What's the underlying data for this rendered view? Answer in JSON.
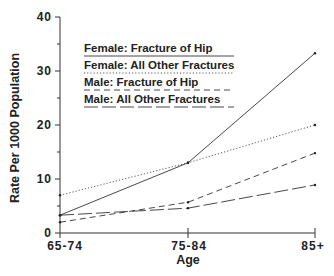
{
  "chart_data": {
    "type": "line",
    "title": "",
    "xlabel": "Age",
    "ylabel": "Rate Per 1000 Population",
    "categories": [
      "65-74",
      "75-84",
      "85+"
    ],
    "ylim": [
      0,
      40
    ],
    "yticks": [
      0,
      10,
      20,
      30,
      40
    ],
    "grid": false,
    "legend_position": "upper-left (inside)",
    "series": [
      {
        "name": "Female: Fracture of Hip",
        "style": "solid",
        "values": [
          3.3,
          13.0,
          33.3
        ]
      },
      {
        "name": "Female: All Other Fractures",
        "style": "dotted",
        "values": [
          7.0,
          13.0,
          20.0
        ]
      },
      {
        "name": "Male: Fracture of Hip",
        "style": "short-dashed",
        "values": [
          2.0,
          5.7,
          14.8
        ]
      },
      {
        "name": "Male: All Other Fractures",
        "style": "long-dashed",
        "values": [
          3.3,
          4.6,
          8.9
        ]
      }
    ]
  },
  "axis": {
    "ytick_labels": [
      "0",
      "10",
      "20",
      "30",
      "40"
    ],
    "xtick_labels": [
      "65-74",
      "75-84",
      "85+"
    ],
    "xlabel": "Age",
    "ylabel": "Rate Per 1000 Population"
  },
  "legend": {
    "items": [
      "Female: Fracture of Hip",
      "Female: All Other Fractures",
      "Male: Fracture of Hip",
      "Male: All Other Fractures"
    ]
  }
}
